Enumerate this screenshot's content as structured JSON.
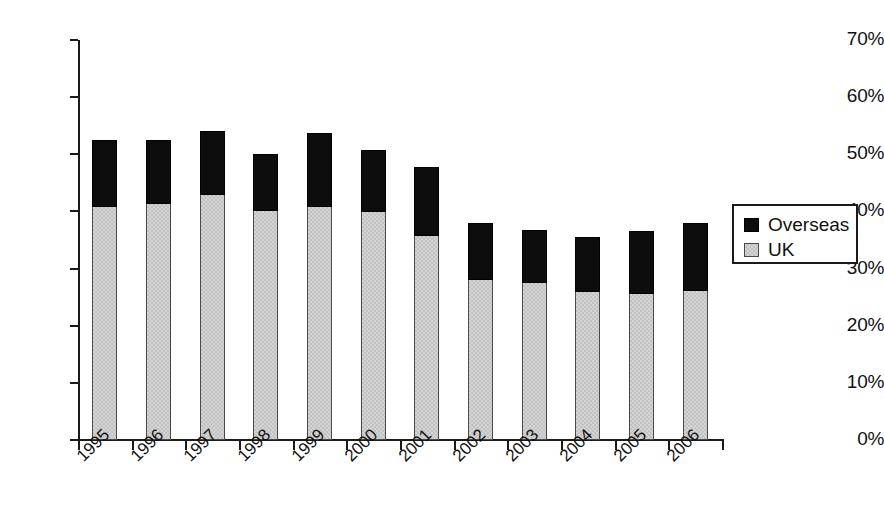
{
  "chart_data": {
    "type": "bar",
    "subtype": "stacked-vertical",
    "title": "",
    "subtitle": "",
    "xlabel": "",
    "ylabel": "",
    "categories": [
      "1995",
      "1996",
      "1997",
      "1998",
      "1999",
      "2000",
      "2001",
      "2002",
      "2003",
      "2004",
      "2005",
      "2006"
    ],
    "series": [
      {
        "name": "UK",
        "color": "#d4d4d4",
        "values": [
          41.0,
          41.5,
          43.0,
          40.3,
          41.0,
          40.0,
          35.8,
          28.2,
          27.6,
          26.0,
          25.7,
          26.2
        ]
      },
      {
        "name": "Overseas",
        "color": "#0d0d0d",
        "values": [
          11.5,
          11.0,
          11.0,
          9.7,
          12.7,
          10.7,
          11.9,
          9.8,
          9.2,
          9.5,
          10.8,
          11.8
        ]
      }
    ],
    "totals": [
      52.5,
      52.5,
      54.0,
      50.0,
      53.7,
      50.7,
      47.7,
      38.0,
      36.8,
      35.5,
      36.5,
      38.0
    ],
    "ylim": [
      0,
      70
    ],
    "ytick_values": [
      0,
      10,
      20,
      30,
      40,
      50,
      60,
      70
    ],
    "ytick_labels": [
      "0%",
      "10%",
      "20%",
      "30%",
      "40%",
      "50%",
      "60%",
      "70%"
    ],
    "grid": false,
    "legend_position": "right",
    "legend_entries": [
      {
        "label": "Overseas",
        "swatch": "black-square-icon"
      },
      {
        "label": "UK",
        "swatch": "gray-square-icon"
      }
    ],
    "value_unit": "%"
  }
}
